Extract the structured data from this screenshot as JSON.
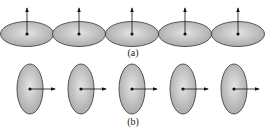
{
  "figure": {
    "panel_a": {
      "label": "(a)",
      "description": "Row of five oblate (horizontal) ellipses touching side by side, each with a dot at center and an arrow pointing up",
      "ellipses": [
        {
          "cx": 27,
          "cy": 34
        },
        {
          "cx": 79,
          "cy": 34
        },
        {
          "cx": 132,
          "cy": 34
        },
        {
          "cx": 185,
          "cy": 34
        },
        {
          "cx": 238,
          "cy": 34
        }
      ],
      "arrow_direction": "up"
    },
    "panel_b": {
      "label": "(b)",
      "description": "Row of five prolate (vertical) ellipses separated, each with a dot at center and an arrow pointing right",
      "ellipses": [
        {
          "cx": 30,
          "cy": 89
        },
        {
          "cx": 81,
          "cy": 89
        },
        {
          "cx": 132,
          "cy": 89
        },
        {
          "cx": 183,
          "cy": 89
        },
        {
          "cx": 234,
          "cy": 89
        }
      ],
      "arrow_direction": "right"
    },
    "colors": {
      "fill_light": "#e2e2e2",
      "fill_dark": "#a8a8a8",
      "stroke": "#333333"
    }
  }
}
